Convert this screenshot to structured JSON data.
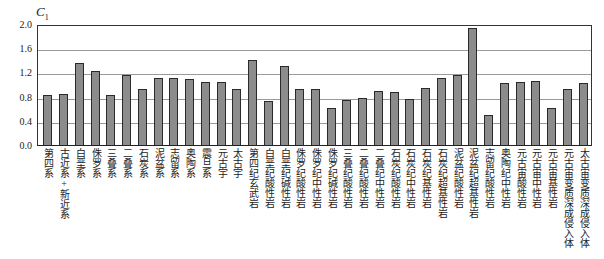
{
  "chart_data": {
    "type": "bar",
    "title": "",
    "xlabel": "",
    "ylabel": "C1",
    "ylim": [
      0.0,
      2.0
    ],
    "yticks": [
      "0.0",
      "0.4",
      "0.8",
      "1.2",
      "1.6",
      "2.0"
    ],
    "grid": true,
    "legend": null,
    "categories": [
      "第四系",
      "古近系+新近系",
      "白垩系",
      "侏罗系",
      "三叠系",
      "二叠系",
      "石炭系",
      "泥盆系",
      "志留系",
      "奥陶系",
      "震旦系",
      "元古宇",
      "太古宇",
      "第四纪玄武岩",
      "白垩纪酸性岩",
      "白垩纪碱性岩",
      "侏罗纪酸性岩",
      "侏罗纪中性岩",
      "侏罗纪碱性岩",
      "三叠纪酸性岩",
      "二叠纪酸性岩",
      "二叠纪中性岩",
      "石炭纪酸性岩",
      "石炭纪中性岩",
      "石炭纪基性岩",
      "石炭纪超基性岩",
      "泥盆纪酸性岩",
      "泥盆纪超基性岩",
      "志留纪酸性岩",
      "奥陶纪中性岩",
      "元古宙酸性岩",
      "元古宙中性岩",
      "元古宙基性岩",
      "元古宙变质深成侵入体",
      "太古宙变质深成侵入体"
    ],
    "values": [
      0.82,
      0.84,
      1.36,
      1.22,
      0.82,
      1.15,
      0.93,
      1.1,
      1.11,
      1.09,
      1.04,
      1.04,
      0.93,
      1.4,
      0.72,
      1.3,
      0.92,
      0.92,
      0.62,
      0.74,
      0.78,
      0.89,
      0.88,
      0.76,
      0.95,
      1.11,
      1.16,
      1.94,
      0.5,
      1.02,
      1.04,
      1.05,
      0.62,
      0.92,
      1.02
    ]
  },
  "axis": {
    "ylabel_main": "C",
    "ylabel_sub": "1"
  }
}
